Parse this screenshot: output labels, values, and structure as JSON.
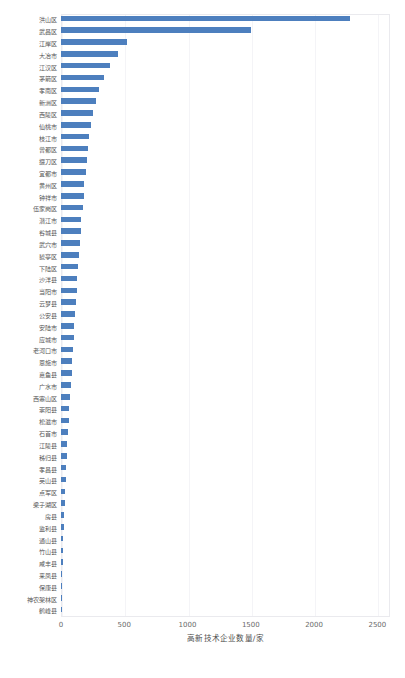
{
  "chart_data": {
    "type": "bar",
    "orientation": "horizontal",
    "title": "",
    "xlabel": "高新技术企业数量/家",
    "ylabel": "",
    "xlim": [
      0,
      2600
    ],
    "xticks": [
      0,
      500,
      1000,
      1500,
      2000,
      2500
    ],
    "xticklabels": [
      "0",
      "500",
      "1000",
      "1500",
      "2000",
      "2500"
    ],
    "grid": true,
    "legend": false,
    "bar_color": "#4d7fbe",
    "categories": [
      "洪山区",
      "武昌区",
      "江岸区",
      "大冶市",
      "江汉区",
      "茅箭区",
      "孝南区",
      "新洲区",
      "西陵区",
      "仙桃市",
      "枝江市",
      "曾都区",
      "掇刀区",
      "宜都市",
      "黄州区",
      "钟祥市",
      "伍家岗区",
      "潜江市",
      "谷城县",
      "武穴市",
      "猇亭区",
      "下陆区",
      "沙洋县",
      "当阳市",
      "云梦县",
      "公安县",
      "安陆市",
      "应城市",
      "老河口市",
      "恩施市",
      "嘉鱼县",
      "广水市",
      "西塞山区",
      "崇阳县",
      "松滋市",
      "石首市",
      "江陵县",
      "秭归县",
      "孝昌县",
      "英山县",
      "点军区",
      "梁子湖区",
      "房县",
      "监利县",
      "通山县",
      "竹山县",
      "咸丰县",
      "来凤县",
      "保康县",
      "神农架林区",
      "鹤峰县"
    ],
    "values": [
      2280,
      1500,
      525,
      450,
      390,
      340,
      300,
      275,
      255,
      240,
      225,
      215,
      205,
      195,
      185,
      178,
      170,
      162,
      155,
      148,
      142,
      136,
      130,
      124,
      118,
      112,
      106,
      100,
      95,
      90,
      85,
      80,
      72,
      66,
      60,
      55,
      50,
      45,
      40,
      36,
      32,
      28,
      24,
      21,
      18,
      15,
      12,
      10,
      8,
      5,
      3
    ]
  },
  "caption": {
    "text": ""
  }
}
